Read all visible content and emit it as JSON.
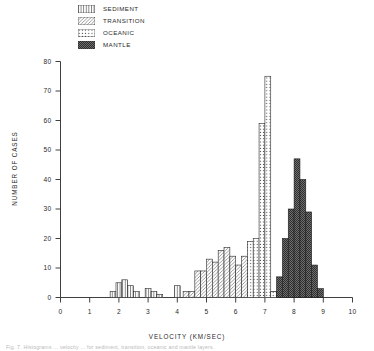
{
  "legend": {
    "items": [
      {
        "label": "SEDIMENT",
        "pattern": "vertical-lines",
        "icon": "sediment-swatch-icon"
      },
      {
        "label": "TRANSITION",
        "pattern": "diagonal-lines",
        "icon": "transition-swatch-icon"
      },
      {
        "label": "OCEANIC",
        "pattern": "dots",
        "icon": "oceanic-swatch-icon"
      },
      {
        "label": "MANTLE",
        "pattern": "solid-dark",
        "icon": "mantle-swatch-icon"
      }
    ]
  },
  "caption": "Fig. 7.  Histograms ... velocity ... for sediment, transition, oceanic and mantle layers.",
  "chart_data": {
    "type": "bar",
    "title": "",
    "subtitle": "",
    "xlabel": "VELOCITY  (KM/SEC)",
    "ylabel": "NUMBER OF CASES",
    "xlim": [
      0,
      10
    ],
    "ylim": [
      0,
      80
    ],
    "xticks": [
      0,
      1,
      2,
      3,
      4,
      5,
      6,
      7,
      8,
      9,
      10
    ],
    "xticklabels": [
      "0",
      "1",
      "2",
      "3",
      "4",
      "5",
      "6",
      "7",
      "8",
      "9",
      "10"
    ],
    "yticks": [
      0,
      10,
      20,
      30,
      40,
      50,
      60,
      70,
      80
    ],
    "yticklabels": [
      "0",
      "10",
      "20",
      "30",
      "40",
      "50",
      "60",
      "70",
      "80"
    ],
    "grid": false,
    "legend_position": "top-left",
    "bin_width": 0.2,
    "series": [
      {
        "name": "SEDIMENT",
        "pattern": "vertical-lines",
        "color": "#ffffff",
        "edgecolor": "#2a2a2a",
        "bins": [
          {
            "x0": 1.7,
            "value": 2
          },
          {
            "x0": 1.9,
            "value": 5
          },
          {
            "x0": 2.1,
            "value": 6
          },
          {
            "x0": 2.3,
            "value": 4
          },
          {
            "x0": 2.5,
            "value": 2
          },
          {
            "x0": 2.9,
            "value": 3
          },
          {
            "x0": 3.1,
            "value": 2
          },
          {
            "x0": 3.3,
            "value": 1
          },
          {
            "x0": 3.9,
            "value": 4
          }
        ]
      },
      {
        "name": "TRANSITION",
        "pattern": "diagonal-lines",
        "color": "#ffffff",
        "edgecolor": "#2a2a2a",
        "bins": [
          {
            "x0": 4.2,
            "value": 2
          },
          {
            "x0": 4.4,
            "value": 2
          },
          {
            "x0": 4.6,
            "value": 9
          },
          {
            "x0": 4.8,
            "value": 9
          },
          {
            "x0": 5.0,
            "value": 13
          },
          {
            "x0": 5.2,
            "value": 12
          },
          {
            "x0": 5.4,
            "value": 16
          },
          {
            "x0": 5.6,
            "value": 17
          },
          {
            "x0": 5.8,
            "value": 14
          },
          {
            "x0": 6.0,
            "value": 11
          },
          {
            "x0": 6.2,
            "value": 14
          },
          {
            "x0": 6.4,
            "value": 10
          },
          {
            "x0": 6.6,
            "value": 5
          },
          {
            "x0": 6.8,
            "value": 4
          },
          {
            "x0": 7.0,
            "value": 2
          },
          {
            "x0": 7.2,
            "value": 2
          }
        ]
      },
      {
        "name": "OCEANIC",
        "pattern": "dots",
        "color": "#ffffff",
        "edgecolor": "#2a2a2a",
        "bins": [
          {
            "x0": 6.4,
            "value": 19
          },
          {
            "x0": 6.6,
            "value": 20
          },
          {
            "x0": 6.8,
            "value": 59
          },
          {
            "x0": 7.0,
            "value": 75
          },
          {
            "x0": 7.2,
            "value": 2
          }
        ]
      },
      {
        "name": "MANTLE",
        "pattern": "solid-dark",
        "color": "#4a4a4a",
        "edgecolor": "#1a1a1a",
        "bins": [
          {
            "x0": 7.4,
            "value": 7
          },
          {
            "x0": 7.6,
            "value": 20
          },
          {
            "x0": 7.8,
            "value": 30
          },
          {
            "x0": 8.0,
            "value": 47
          },
          {
            "x0": 8.2,
            "value": 40
          },
          {
            "x0": 8.4,
            "value": 29
          },
          {
            "x0": 8.6,
            "value": 11
          },
          {
            "x0": 8.8,
            "value": 3
          }
        ]
      }
    ]
  }
}
